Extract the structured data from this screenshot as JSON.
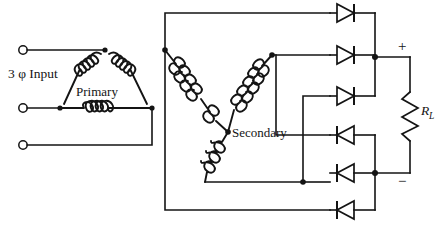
{
  "figure": {
    "stroke_color": "#141414",
    "background_color": "#ffffff"
  },
  "labels": {
    "input": "3 φ Input",
    "primary": "Primary",
    "secondary": "Secondary",
    "load_resistor": "R",
    "load_resistor_sub": "L",
    "positive": "+",
    "negative": "−"
  },
  "components": {
    "input_terminals": [
      {
        "name": "phase-a-terminal",
        "x": 23,
        "y": 50
      },
      {
        "name": "phase-b-terminal",
        "x": 23,
        "y": 108
      },
      {
        "name": "phase-c-terminal",
        "x": 23,
        "y": 145
      }
    ],
    "primary": {
      "configuration": "delta",
      "windings": 3,
      "nodes": [
        {
          "name": "primary-top-node",
          "x": 105,
          "y": 50
        },
        {
          "name": "primary-left-node",
          "x": 60,
          "y": 108
        },
        {
          "name": "primary-right-node",
          "x": 152,
          "y": 108
        }
      ]
    },
    "secondary": {
      "configuration": "wye",
      "windings": 3,
      "center": {
        "x": 228,
        "y": 132
      },
      "nodes": [
        {
          "name": "secondary-phase-1-node",
          "x": 165,
          "y": 50
        },
        {
          "name": "secondary-phase-2-node",
          "x": 272,
          "y": 55
        },
        {
          "name": "secondary-phase-3-node",
          "x": 205,
          "y": 182
        }
      ]
    },
    "diodes": [
      {
        "name": "diode-d1",
        "y": 14,
        "direction": "right",
        "group": "positive"
      },
      {
        "name": "diode-d2",
        "y": 57,
        "direction": "right",
        "group": "positive"
      },
      {
        "name": "diode-d3",
        "y": 98,
        "direction": "right",
        "group": "positive"
      },
      {
        "name": "diode-d4",
        "y": 135,
        "direction": "left",
        "group": "negative"
      },
      {
        "name": "diode-d5",
        "y": 173,
        "direction": "left",
        "group": "negative"
      },
      {
        "name": "diode-d6",
        "y": 213,
        "direction": "left",
        "group": "negative"
      }
    ],
    "load": {
      "name": "load-resistor",
      "type": "resistor",
      "orientation": "vertical",
      "x": 410,
      "top_y": 57,
      "bottom_y": 178
    },
    "rails": {
      "positive_rail_y": 57,
      "negative_rail_y": 178,
      "bus_x": 375
    }
  }
}
